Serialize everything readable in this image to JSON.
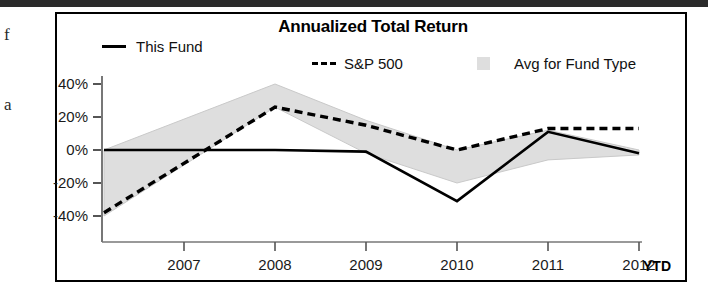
{
  "page": {
    "edge_glyphs": [
      "f",
      "a"
    ]
  },
  "chart": {
    "title": "Annualized Total Return",
    "legend": [
      {
        "label": "This Fund",
        "marker": "solid-line-swatch"
      },
      {
        "label": "S&P 500",
        "marker": "dashed-line-swatch"
      },
      {
        "label": "Avg for Fund Type",
        "marker": "shaded-band-swatch"
      }
    ],
    "ytd_label": "YTD"
  },
  "chart_data": {
    "type": "line",
    "title": "Annualized Total Return",
    "xlabel": "",
    "ylabel": "",
    "categories": [
      "2007",
      "2008",
      "2009",
      "2010",
      "2011",
      "2012"
    ],
    "x_tick_labels": [
      "2007",
      "2008",
      "2009",
      "2010",
      "2011",
      "2012"
    ],
    "y_tick_labels": [
      "40%",
      "20%",
      "0%",
      "-20%",
      "-40%"
    ],
    "y_ticks": [
      40,
      20,
      0,
      -20,
      -40
    ],
    "ylim": [
      -45,
      45
    ],
    "grid": false,
    "legend_position": "top",
    "series": [
      {
        "name": "This Fund",
        "style": "solid",
        "color": "#000000",
        "values": [
          0,
          0,
          -1,
          -31,
          11,
          -2
        ]
      },
      {
        "name": "S&P 500",
        "style": "dashed",
        "color": "#000000",
        "values": [
          -38,
          26,
          15,
          0,
          13,
          13
        ]
      },
      {
        "name": "Avg for Fund Type",
        "style": "shaded-band",
        "color": "#dedede",
        "upper": [
          0,
          40,
          18,
          0,
          12,
          0
        ],
        "lower": [
          -40,
          26,
          -2,
          -20,
          -6,
          -3
        ]
      }
    ]
  }
}
